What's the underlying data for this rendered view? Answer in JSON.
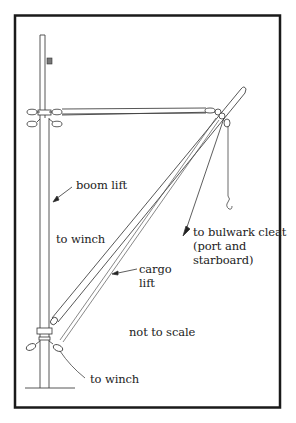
{
  "diagram": {
    "colors": {
      "frame": "#1a1a1a",
      "line": "#333333",
      "background": "#ffffff"
    },
    "labels": {
      "boom_lift": "boom lift",
      "to_winch_upper": "to winch",
      "to_bulwark_line1": "to bulwark cleat",
      "to_bulwark_line2": "(port and",
      "to_bulwark_line3": "starboard)",
      "cargo_lift_line1": "cargo",
      "cargo_lift_line2": "lift",
      "not_to_scale": "not to scale",
      "to_winch_lower": "to winch"
    }
  }
}
